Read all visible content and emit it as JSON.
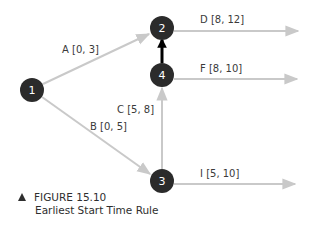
{
  "figure": {
    "number_label": "FIGURE 15.10",
    "title": "Earliest Start Time Rule",
    "marker_icon": "triangle-up-icon"
  },
  "colors": {
    "node_fill": "#2b2b2b",
    "edge_gray": "#c9c9c9",
    "critical_edge": "#000000",
    "text": "#3a3a3a"
  },
  "nodes": [
    {
      "id": "1",
      "label": "1",
      "x": 32,
      "y": 90
    },
    {
      "id": "2",
      "label": "2",
      "x": 162,
      "y": 28
    },
    {
      "id": "3",
      "label": "3",
      "x": 162,
      "y": 181
    },
    {
      "id": "4",
      "label": "4",
      "x": 162,
      "y": 75
    }
  ],
  "edges": [
    {
      "id": "A",
      "label": "A [0, 3]",
      "from": "1",
      "to": "2"
    },
    {
      "id": "B",
      "label": "B [0, 5]",
      "from": "1",
      "to": "3"
    },
    {
      "id": "C",
      "label": "C [5, 8]",
      "from": "3",
      "to": "4"
    },
    {
      "id": "D",
      "label": "D [8, 12]",
      "from": "2",
      "to": "out"
    },
    {
      "id": "F",
      "label": "F [8, 10]",
      "from": "4",
      "to": "out"
    },
    {
      "id": "I",
      "label": "I [5, 10]",
      "from": "3",
      "to": "out"
    },
    {
      "id": "dummy",
      "label": "",
      "from": "4",
      "to": "2"
    }
  ]
}
